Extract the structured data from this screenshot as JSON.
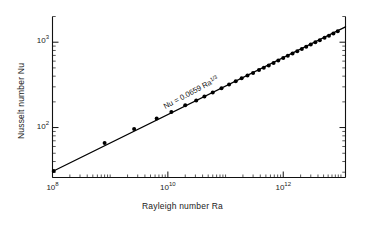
{
  "figure": {
    "background": "#ffffff",
    "ink": "#111111",
    "line_color": "#000000",
    "marker_color": "#000000"
  },
  "annotation": {
    "prefix": "Nu = 0.0659  Ra",
    "exponent": "1/3",
    "full_text": "Nu = 0.0659  Ra1/3"
  },
  "axes": {
    "x": {
      "title": "Rayleigh number  Ra",
      "major_ticks": [
        {
          "label_mantissa": "10",
          "label_exponent": "8",
          "value": 100000000.0
        },
        {
          "label_mantissa": "10",
          "label_exponent": "10",
          "value": 10000000000.0
        },
        {
          "label_mantissa": "10",
          "label_exponent": "12",
          "value": 1000000000000.0
        }
      ],
      "limits": [
        100000000.0,
        12000000000000.0
      ],
      "scale": "log10"
    },
    "y": {
      "title": "Nusselt number Nu",
      "major_ticks": [
        {
          "label_mantissa": "10",
          "label_exponent": "2",
          "value": 100
        },
        {
          "label_mantissa": "10",
          "label_exponent": "3",
          "value": 1000
        }
      ],
      "limits": [
        26.0,
        2000.0
      ],
      "scale": "log10"
    }
  },
  "chart_data": {
    "type": "scatter",
    "title": "",
    "xlabel": "Rayleigh number  Ra",
    "ylabel": "Nusselt number Nu",
    "xscale": "log",
    "yscale": "log",
    "xlim": [
      100000000.0,
      12000000000000.0
    ],
    "ylim": [
      26.0,
      2000.0
    ],
    "grid": false,
    "legend": null,
    "annotations": [
      {
        "text": "Nu = 0.0659  Ra1/3",
        "x": 9000000000.0,
        "y": 165,
        "rotation_deg": -28
      }
    ],
    "series": [
      {
        "name": "fit",
        "type": "line",
        "equation": "Nu = 0.0659 * Ra^(1/3)",
        "coefficient": 0.0659,
        "exponent": 0.3333,
        "x": [
          100000000.0,
          12000000000000.0
        ],
        "y": [
          30.6,
          1512.0
        ]
      },
      {
        "name": "measurements",
        "type": "scatter",
        "marker": "filled-circle",
        "x": [
          105000000.0,
          800000000.0,
          2600000000.0,
          6400000000.0,
          11500000000.0,
          20000000000.0,
          31000000000.0,
          43000000000.0,
          60000000000.0,
          85000000000.0,
          115000000000.0,
          150000000000.0,
          190000000000.0,
          240000000000.0,
          300000000000.0,
          380000000000.0,
          460000000000.0,
          560000000000.0,
          680000000000.0,
          820000000000.0,
          1000000000000.0,
          1200000000000.0,
          1450000000000.0,
          1750000000000.0,
          2100000000000.0,
          2500000000000.0,
          3000000000000.0,
          3600000000000.0,
          4300000000000.0,
          5200000000000.0,
          6200000000000.0,
          7400000000000.0,
          8800000000000.0
        ],
        "y": [
          31.0,
          66.0,
          96.0,
          128.0,
          152.0,
          182.0,
          208.0,
          231.0,
          258.0,
          289.0,
          320.0,
          349.0,
          377.0,
          406.0,
          437.0,
          471.0,
          502.0,
          535.0,
          572.0,
          610.0,
          654.0,
          694.0,
          738.0,
          785.0,
          833.0,
          883.0,
          938.0,
          996.0,
          1056.0,
          1126.0,
          1192.0,
          1264.0,
          1342.0
        ]
      }
    ]
  }
}
